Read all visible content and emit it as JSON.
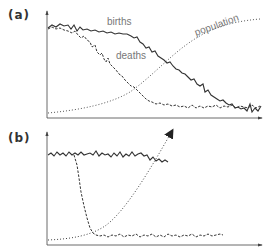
{
  "panels": [
    {
      "label": "(a)",
      "curves": [
        {
          "name": "births",
          "style": "solid"
        },
        {
          "name": "deaths",
          "style": "dashed"
        },
        {
          "name": "population",
          "style": "dotted"
        }
      ],
      "annotations": {
        "births": "births",
        "deaths": "deaths",
        "population": "population"
      }
    },
    {
      "label": "(b)",
      "curves": [
        {
          "name": "births",
          "style": "solid",
          "description": "high and flat, truncated"
        },
        {
          "name": "deaths",
          "style": "dashed",
          "description": "sharp drop to low level"
        },
        {
          "name": "population",
          "style": "dotted-arrow",
          "description": "rapid exponential growth"
        }
      ]
    }
  ],
  "colors": {
    "line": "#333333",
    "axis": "#444444",
    "label_text": "#777777"
  }
}
